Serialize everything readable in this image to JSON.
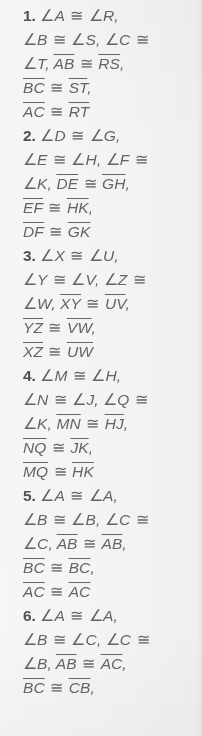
{
  "page": {
    "kind": "textbook-answer-key-column",
    "background_color": "#f3f3f1",
    "text_color": "#5f6569",
    "number_color": "#4c5256",
    "total_items": 6,
    "last_line_clipped": true
  },
  "answers": [
    {
      "number": "1.",
      "lines": [
        [
          {
            "t": "num",
            "v": "1."
          },
          {
            "t": "sp",
            "v": " "
          },
          {
            "t": "ang",
            "v": "∠"
          },
          {
            "t": "it",
            "v": "A"
          },
          {
            "t": "cong",
            "v": " ≅ "
          },
          {
            "t": "ang",
            "v": "∠"
          },
          {
            "t": "it",
            "v": "R,"
          }
        ],
        [
          {
            "t": "ang",
            "v": "∠"
          },
          {
            "t": "it",
            "v": "B"
          },
          {
            "t": "cong",
            "v": " ≅ "
          },
          {
            "t": "ang",
            "v": "∠"
          },
          {
            "t": "it",
            "v": "S,"
          },
          {
            "t": "sp",
            "v": " "
          },
          {
            "t": "ang",
            "v": "∠"
          },
          {
            "t": "it",
            "v": "C"
          },
          {
            "t": "cong",
            "v": " ≅"
          }
        ],
        [
          {
            "t": "ang",
            "v": "∠"
          },
          {
            "t": "it",
            "v": "T,"
          },
          {
            "t": "sp",
            "v": " "
          },
          {
            "t": "seg",
            "v": "AB"
          },
          {
            "t": "cong",
            "v": " ≅ "
          },
          {
            "t": "seg",
            "v": "RS"
          },
          {
            "t": "it",
            "v": ","
          }
        ],
        [
          {
            "t": "seg",
            "v": "BC"
          },
          {
            "t": "cong",
            "v": " ≅ "
          },
          {
            "t": "seg",
            "v": "ST"
          },
          {
            "t": "it",
            "v": ","
          }
        ],
        [
          {
            "t": "seg",
            "v": "AC"
          },
          {
            "t": "cong",
            "v": " ≅ "
          },
          {
            "t": "seg",
            "v": "RT"
          }
        ]
      ]
    },
    {
      "number": "2.",
      "lines": [
        [
          {
            "t": "num",
            "v": "2."
          },
          {
            "t": "sp",
            "v": " "
          },
          {
            "t": "ang",
            "v": "∠"
          },
          {
            "t": "it",
            "v": "D"
          },
          {
            "t": "cong",
            "v": " ≅ "
          },
          {
            "t": "ang",
            "v": "∠"
          },
          {
            "t": "it",
            "v": "G,"
          }
        ],
        [
          {
            "t": "ang",
            "v": "∠"
          },
          {
            "t": "it",
            "v": "E"
          },
          {
            "t": "cong",
            "v": " ≅ "
          },
          {
            "t": "ang",
            "v": "∠"
          },
          {
            "t": "it",
            "v": "H,"
          },
          {
            "t": "sp",
            "v": " "
          },
          {
            "t": "ang",
            "v": "∠"
          },
          {
            "t": "it",
            "v": "F"
          },
          {
            "t": "cong",
            "v": " ≅"
          }
        ],
        [
          {
            "t": "ang",
            "v": "∠"
          },
          {
            "t": "it",
            "v": "K,"
          },
          {
            "t": "sp",
            "v": " "
          },
          {
            "t": "seg",
            "v": "DE"
          },
          {
            "t": "cong",
            "v": " ≅ "
          },
          {
            "t": "seg",
            "v": "GH"
          },
          {
            "t": "it",
            "v": ","
          }
        ],
        [
          {
            "t": "seg",
            "v": "EF"
          },
          {
            "t": "cong",
            "v": " ≅ "
          },
          {
            "t": "seg",
            "v": "HK"
          },
          {
            "t": "it",
            "v": ","
          }
        ],
        [
          {
            "t": "seg",
            "v": "DF"
          },
          {
            "t": "cong",
            "v": " ≅ "
          },
          {
            "t": "seg",
            "v": "GK"
          }
        ]
      ]
    },
    {
      "number": "3.",
      "lines": [
        [
          {
            "t": "num",
            "v": "3."
          },
          {
            "t": "sp",
            "v": " "
          },
          {
            "t": "ang",
            "v": "∠"
          },
          {
            "t": "it",
            "v": "X"
          },
          {
            "t": "cong",
            "v": " ≅ "
          },
          {
            "t": "ang",
            "v": "∠"
          },
          {
            "t": "it",
            "v": "U,"
          }
        ],
        [
          {
            "t": "ang",
            "v": "∠"
          },
          {
            "t": "it",
            "v": "Y"
          },
          {
            "t": "cong",
            "v": " ≅ "
          },
          {
            "t": "ang",
            "v": "∠"
          },
          {
            "t": "it",
            "v": "V,"
          },
          {
            "t": "sp",
            "v": " "
          },
          {
            "t": "ang",
            "v": "∠"
          },
          {
            "t": "it",
            "v": "Z"
          },
          {
            "t": "cong",
            "v": " ≅"
          }
        ],
        [
          {
            "t": "ang",
            "v": "∠"
          },
          {
            "t": "it",
            "v": "W,"
          },
          {
            "t": "sp",
            "v": " "
          },
          {
            "t": "seg",
            "v": "XY"
          },
          {
            "t": "cong",
            "v": " ≅ "
          },
          {
            "t": "seg",
            "v": "UV"
          },
          {
            "t": "it",
            "v": ","
          }
        ],
        [
          {
            "t": "seg",
            "v": "YZ"
          },
          {
            "t": "cong",
            "v": " ≅ "
          },
          {
            "t": "seg",
            "v": "VW"
          },
          {
            "t": "it",
            "v": ","
          }
        ],
        [
          {
            "t": "seg",
            "v": "XZ"
          },
          {
            "t": "cong",
            "v": " ≅ "
          },
          {
            "t": "seg",
            "v": "UW"
          }
        ]
      ]
    },
    {
      "number": "4.",
      "lines": [
        [
          {
            "t": "num",
            "v": "4."
          },
          {
            "t": "sp",
            "v": " "
          },
          {
            "t": "ang",
            "v": "∠"
          },
          {
            "t": "it",
            "v": "M"
          },
          {
            "t": "cong",
            "v": " ≅ "
          },
          {
            "t": "ang",
            "v": "∠"
          },
          {
            "t": "it",
            "v": "H,"
          }
        ],
        [
          {
            "t": "ang",
            "v": "∠"
          },
          {
            "t": "it",
            "v": "N"
          },
          {
            "t": "cong",
            "v": " ≅ "
          },
          {
            "t": "ang",
            "v": "∠"
          },
          {
            "t": "it",
            "v": "J,"
          },
          {
            "t": "sp",
            "v": " "
          },
          {
            "t": "ang",
            "v": "∠"
          },
          {
            "t": "it",
            "v": "Q"
          },
          {
            "t": "cong",
            "v": " ≅"
          }
        ],
        [
          {
            "t": "ang",
            "v": "∠"
          },
          {
            "t": "it",
            "v": "K,"
          },
          {
            "t": "sp",
            "v": " "
          },
          {
            "t": "seg",
            "v": "MN"
          },
          {
            "t": "cong",
            "v": " ≅ "
          },
          {
            "t": "seg",
            "v": "HJ"
          },
          {
            "t": "it",
            "v": ","
          }
        ],
        [
          {
            "t": "seg",
            "v": "NQ"
          },
          {
            "t": "cong",
            "v": " ≅ "
          },
          {
            "t": "seg",
            "v": "JK"
          },
          {
            "t": "it",
            "v": ","
          }
        ],
        [
          {
            "t": "seg",
            "v": "MQ"
          },
          {
            "t": "cong",
            "v": " ≅ "
          },
          {
            "t": "seg",
            "v": "HK"
          }
        ]
      ]
    },
    {
      "number": "5.",
      "lines": [
        [
          {
            "t": "num",
            "v": "5."
          },
          {
            "t": "sp",
            "v": " "
          },
          {
            "t": "ang",
            "v": "∠"
          },
          {
            "t": "it",
            "v": "A"
          },
          {
            "t": "cong",
            "v": " ≅ "
          },
          {
            "t": "ang",
            "v": "∠"
          },
          {
            "t": "it",
            "v": "A,"
          }
        ],
        [
          {
            "t": "ang",
            "v": "∠"
          },
          {
            "t": "it",
            "v": "B"
          },
          {
            "t": "cong",
            "v": " ≅ "
          },
          {
            "t": "ang",
            "v": "∠"
          },
          {
            "t": "it",
            "v": "B,"
          },
          {
            "t": "sp",
            "v": " "
          },
          {
            "t": "ang",
            "v": "∠"
          },
          {
            "t": "it",
            "v": "C"
          },
          {
            "t": "cong",
            "v": " ≅"
          }
        ],
        [
          {
            "t": "ang",
            "v": "∠"
          },
          {
            "t": "it",
            "v": "C,"
          },
          {
            "t": "sp",
            "v": " "
          },
          {
            "t": "seg",
            "v": "AB"
          },
          {
            "t": "cong",
            "v": " ≅ "
          },
          {
            "t": "seg",
            "v": "AB"
          },
          {
            "t": "it",
            "v": ","
          }
        ],
        [
          {
            "t": "seg",
            "v": "BC"
          },
          {
            "t": "cong",
            "v": " ≅ "
          },
          {
            "t": "seg",
            "v": "BC"
          },
          {
            "t": "it",
            "v": ","
          }
        ],
        [
          {
            "t": "seg",
            "v": "AC"
          },
          {
            "t": "cong",
            "v": " ≅ "
          },
          {
            "t": "seg",
            "v": "AC"
          }
        ]
      ]
    },
    {
      "number": "6.",
      "lines": [
        [
          {
            "t": "num",
            "v": "6."
          },
          {
            "t": "sp",
            "v": " "
          },
          {
            "t": "ang",
            "v": "∠"
          },
          {
            "t": "it",
            "v": "A"
          },
          {
            "t": "cong",
            "v": " ≅ "
          },
          {
            "t": "ang",
            "v": "∠"
          },
          {
            "t": "it",
            "v": "A,"
          }
        ],
        [
          {
            "t": "ang",
            "v": "∠"
          },
          {
            "t": "it",
            "v": "B"
          },
          {
            "t": "cong",
            "v": " ≅ "
          },
          {
            "t": "ang",
            "v": "∠"
          },
          {
            "t": "it",
            "v": "C,"
          },
          {
            "t": "sp",
            "v": " "
          },
          {
            "t": "ang",
            "v": "∠"
          },
          {
            "t": "it",
            "v": "C"
          },
          {
            "t": "cong",
            "v": " ≅"
          }
        ],
        [
          {
            "t": "ang",
            "v": "∠"
          },
          {
            "t": "it",
            "v": "B,"
          },
          {
            "t": "sp",
            "v": " "
          },
          {
            "t": "seg",
            "v": "AB"
          },
          {
            "t": "cong",
            "v": " ≅ "
          },
          {
            "t": "seg",
            "v": "AC"
          },
          {
            "t": "it",
            "v": ","
          }
        ],
        [
          {
            "t": "seg",
            "v": "BC"
          },
          {
            "t": "cong",
            "v": " ≅ "
          },
          {
            "t": "seg",
            "v": "CB"
          },
          {
            "t": "it",
            "v": ","
          }
        ]
      ]
    }
  ]
}
